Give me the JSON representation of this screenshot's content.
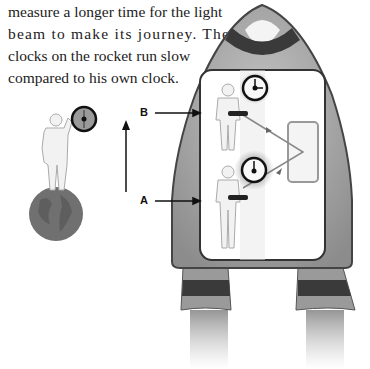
{
  "caption": {
    "lines": [
      "measure a longer time for the light",
      "beam to make its journey. The",
      "clocks on the rocket run slow",
      "compared to his own clock."
    ]
  },
  "labels": {
    "a": "A",
    "b": "B"
  },
  "figure": {
    "elements": [
      "observer-on-earth",
      "earth-globe",
      "observer-clock",
      "motion-arrow",
      "rocket",
      "astronaut-a",
      "astronaut-b",
      "clock-a",
      "clock-b",
      "mirror",
      "light-beam",
      "exhaust-flames"
    ],
    "colors": {
      "rocket_hull": "#9a9a9a",
      "rocket_stripe": "#3a3a3a",
      "cabin": "#ffffff",
      "earth": "#6f6f6f",
      "figure_fill": "#eeeeee"
    }
  }
}
